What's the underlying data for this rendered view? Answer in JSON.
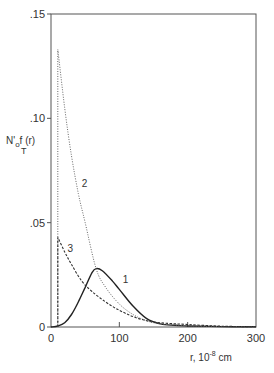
{
  "chart_data": {
    "type": "line",
    "title": "",
    "xlabel": "r, 10^-8 cm",
    "xlabel_parts": {
      "prefix": "r, 10",
      "exp": "-8",
      "unit": " cm"
    },
    "ylabel": "N'_o f_T(r)",
    "ylabel_parts": {
      "main": "N'",
      "sub": "o",
      "f": "f",
      "paren": "(r)",
      "T": "T"
    },
    "xlim": [
      0,
      300
    ],
    "ylim": [
      0,
      0.15
    ],
    "x_ticks": [
      "0",
      "100",
      "200",
      "300"
    ],
    "y_ticks": [
      ".15",
      ".10",
      ".05",
      "0"
    ],
    "grid": false,
    "legend": "inline curve labels 1, 2, 3",
    "series": [
      {
        "name": "1",
        "style": "solid",
        "x": [
          0,
          10,
          20,
          30,
          40,
          50,
          60,
          66,
          75,
          90,
          100,
          120,
          140,
          160,
          180,
          200,
          250,
          300
        ],
        "y": [
          0,
          0.0005,
          0.002,
          0.006,
          0.012,
          0.019,
          0.026,
          0.028,
          0.027,
          0.022,
          0.018,
          0.01,
          0.004,
          0.0015,
          0.0008,
          0.0005,
          0.0002,
          0.0001
        ]
      },
      {
        "name": "2",
        "style": "dotted",
        "x": [
          10,
          10,
          20,
          30,
          40,
          50,
          66,
          80,
          100,
          120,
          140,
          160,
          200,
          250,
          300
        ],
        "y": [
          0,
          0.133,
          0.105,
          0.082,
          0.064,
          0.05,
          0.028,
          0.019,
          0.011,
          0.006,
          0.003,
          0.0015,
          0.0006,
          0.0002,
          0.0001
        ]
      },
      {
        "name": "3",
        "style": "dashed",
        "x": [
          10,
          10,
          20,
          30,
          45,
          60,
          80,
          100,
          120,
          140,
          160,
          200,
          250,
          300
        ],
        "y": [
          0,
          0.043,
          0.036,
          0.03,
          0.022,
          0.017,
          0.012,
          0.008,
          0.005,
          0.003,
          0.002,
          0.0012,
          0.0004,
          0.0001
        ]
      }
    ],
    "annotations": [
      {
        "text": "1",
        "x": 105,
        "y": 0.021
      },
      {
        "text": "2",
        "x": 45,
        "y": 0.067
      },
      {
        "text": "3",
        "x": 24,
        "y": 0.036
      }
    ]
  }
}
